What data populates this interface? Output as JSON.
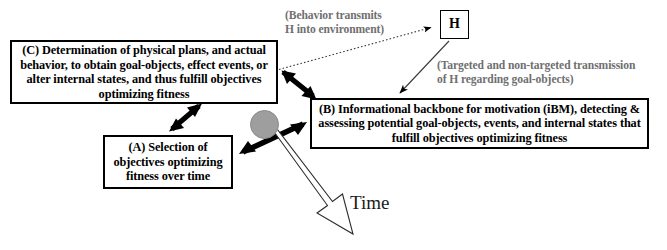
{
  "diagram": {
    "title_text_present": false,
    "nodes": {
      "c": {
        "id": "C",
        "label": "(C) Determination of physical plans, and actual behavior, to obtain goal-objects, effect events, or alter internal states, and thus fulfill objectives optimizing fitness"
      },
      "a": {
        "id": "A",
        "label": "(A) Selection of objectives optimizing fitness over time"
      },
      "b": {
        "id": "B",
        "label": "(B) Informational backbone for motivation (iBM), detecting & assessing potential goal-objects, events, and internal states that fulfill objectives optimizing fitness"
      },
      "h": {
        "id": "H",
        "label": "H"
      }
    },
    "annotations": {
      "behavior_transmits": "(Behavior transmits\nH into environment)",
      "targeted_transmission": "(Targeted and non-targeted transmission\nof H regarding goal-objects)"
    },
    "time_axis": {
      "label": "Time"
    },
    "edges": [
      {
        "name": "c-to-h-dotted",
        "from": "C",
        "to": "H",
        "style": "dotted",
        "arrowheads": "single-end"
      },
      {
        "name": "h-to-b-thin",
        "from": "H",
        "to": "B",
        "style": "solid-thin",
        "arrowheads": "single-end"
      },
      {
        "name": "c-to-b-double",
        "from": "C",
        "to": "B",
        "style": "solid-thick",
        "arrowheads": "double"
      },
      {
        "name": "c-to-a-double",
        "from": "C",
        "to": "A",
        "style": "solid-thick",
        "arrowheads": "double"
      },
      {
        "name": "hub-to-a-b-double",
        "from": "A",
        "to": "B",
        "style": "solid-thick",
        "arrowheads": "double"
      },
      {
        "name": "time-arrow",
        "from": "hub",
        "to": "time",
        "style": "outlined-block",
        "arrowheads": "single-end"
      }
    ],
    "colors": {
      "stroke": "#000000",
      "annotation_text": "#6f6f6f",
      "hub_fill": "#9e9e9e",
      "background": "#ffffff"
    }
  }
}
